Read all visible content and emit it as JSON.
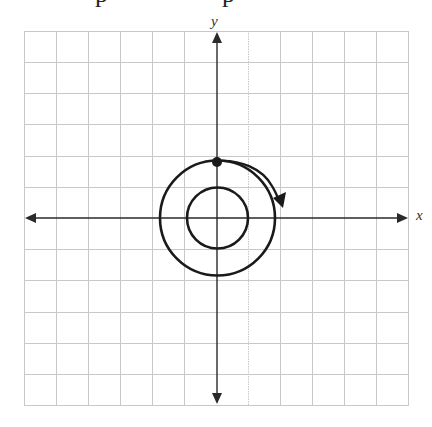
{
  "heading_cropped": {
    "visible_glyph_fragments": [
      "p",
      "p"
    ]
  },
  "axes": {
    "x_label": "x",
    "y_label": "y"
  },
  "grid": {
    "columns": 12,
    "rows": 12,
    "x_min": -6,
    "x_max": 6,
    "y_min": -6,
    "y_max": 6,
    "line_color": "#c8c8c8"
  },
  "figure": {
    "center": [
      0,
      0
    ],
    "inner_circle_radius": 1,
    "outer_circle_radius": 1.8,
    "start_point": [
      0,
      1.8
    ],
    "rotation_arrow": "clockwise",
    "stroke_color": "#1a1a1a"
  }
}
